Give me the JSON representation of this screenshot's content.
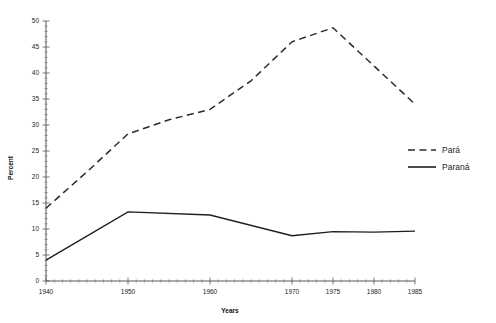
{
  "chart_data": {
    "type": "line",
    "title": "",
    "xlabel": "Years",
    "ylabel": "Percent",
    "xlim": [
      1940,
      1985
    ],
    "ylim": [
      0,
      50
    ],
    "grid": false,
    "legend_position": "right-middle",
    "x_tick_labels": [
      "1940",
      "1950",
      "1960",
      "1970",
      "1975",
      "1980",
      "1985"
    ],
    "x_tick_values": [
      1940,
      1950,
      1960,
      1970,
      1975,
      1980,
      1985
    ],
    "y_tick_labels": [
      "0",
      "5",
      "10",
      "15",
      "20",
      "25",
      "30",
      "35",
      "40",
      "45",
      "50"
    ],
    "y_tick_values": [
      0,
      5,
      10,
      15,
      20,
      25,
      30,
      35,
      40,
      45,
      50
    ],
    "series": [
      {
        "name": "Pará",
        "style": "dashed",
        "color": "#2b2b2b",
        "x": [
          1940,
          1945,
          1950,
          1955,
          1960,
          1965,
          1970,
          1975,
          1985
        ],
        "values": [
          14.0,
          21.0,
          28.3,
          31.0,
          33.0,
          38.5,
          46.0,
          48.7,
          34.0
        ]
      },
      {
        "name": "Paraná",
        "style": "solid",
        "color": "#1f1f1f",
        "x": [
          1940,
          1950,
          1960,
          1970,
          1975,
          1980,
          1985
        ],
        "values": [
          4.0,
          13.3,
          12.7,
          8.7,
          9.5,
          9.4,
          9.6
        ]
      }
    ]
  },
  "legend": {
    "items": [
      {
        "label": "Pará",
        "style": "dashed"
      },
      {
        "label": "Paraná",
        "style": "solid"
      }
    ]
  },
  "axes": {
    "y_title": "Percent",
    "x_title": "Years"
  }
}
